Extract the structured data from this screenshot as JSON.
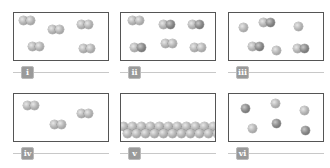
{
  "figure": {
    "panels": [
      {
        "label": "i",
        "description": "five diatomic molecules of identical atoms"
      },
      {
        "label": "ii",
        "description": "six diatomic molecules of identical atoms"
      },
      {
        "label": "iii",
        "description": "mixture of three single atoms and three diatomic molecules"
      },
      {
        "label": "iv",
        "description": "three diatomic molecules spaced apart"
      },
      {
        "label": "v",
        "description": "closely packed atoms at bottom of container (solid/liquid)"
      },
      {
        "label": "vi",
        "description": "six single atoms, mixture of two element types"
      }
    ]
  },
  "colors": {
    "border": "#555555",
    "particle_light": "#b8b8b8",
    "particle_dark": "#8c8c8c",
    "badge": "#9a9a9a",
    "line": "#c8c8c8"
  }
}
